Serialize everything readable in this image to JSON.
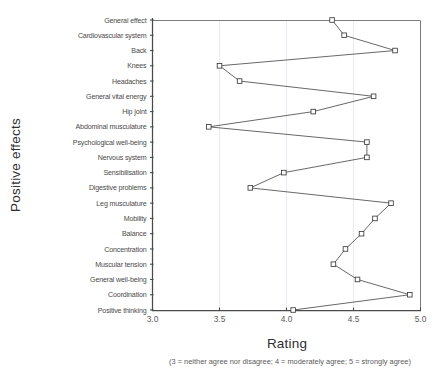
{
  "chart_data": {
    "type": "line",
    "title": "",
    "xlabel": "Rating",
    "ylabel": "Positive effects",
    "orientation": "horizontal",
    "xlim": [
      3.0,
      5.0
    ],
    "xticks": [
      "3.0",
      "3.5",
      "4.0",
      "4.5",
      "5.0"
    ],
    "xtick_values": [
      3.0,
      3.5,
      4.0,
      4.5,
      5.0
    ],
    "grid": "vertical",
    "legend": "none",
    "categories": [
      "General effect",
      "Cardiovascular system",
      "Back",
      "Knees",
      "Headaches",
      "General vital energy",
      "Hip joint",
      "Abdominal musculature",
      "Psychological well-being",
      "Nervous system",
      "Sensibilisation",
      "Digestive problems",
      "Leg musculature",
      "Mobility",
      "Balance",
      "Concentration",
      "Muscular tension",
      "General well-being",
      "Coordination",
      "Positive thinking"
    ],
    "values": [
      4.34,
      4.43,
      4.81,
      3.5,
      3.65,
      4.65,
      4.2,
      3.42,
      4.6,
      4.6,
      3.98,
      3.73,
      4.78,
      4.66,
      4.56,
      4.44,
      4.35,
      4.53,
      4.92,
      4.05
    ],
    "caption": "(3 = neither agree nor disagree; 4 = moderately agree; 5 = strongly agree)",
    "marker": "open-square"
  },
  "colors": {
    "line": "#4d4d4d",
    "marker_fill": "#ffffff",
    "marker_stroke": "#3c3c3c",
    "grid": "#dfe3ea",
    "axis": "#4a4a4a",
    "text": "#4a4a4a",
    "background": "#ffffff"
  }
}
